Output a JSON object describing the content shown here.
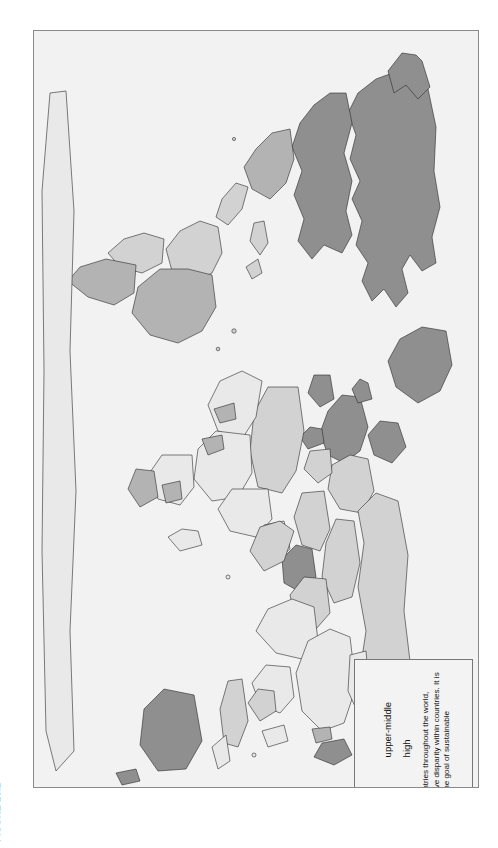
{
  "figure": {
    "label": "FIGURE 13.1"
  },
  "legend": {
    "title": "GNP per Capita in U.S. Dollars",
    "entries": [
      {
        "key": "low",
        "label": "low",
        "color": "#e9e9e9"
      },
      {
        "key": "upper-middle",
        "label": "upper-middle",
        "color": "#b3b3b3"
      },
      {
        "key": "lower-middle",
        "label": "lower-middle",
        "color": "#d2d2d2"
      },
      {
        "key": "high",
        "label": "high",
        "color": "#8f8f8f"
      }
    ],
    "note": "This map depicts relative income of people in countries throughout the world, although it does not address the issue of the relative disparity within countries. It is a summary of the enormous challenge posed by the goal of sustainable development."
  },
  "map": {
    "projection_note": "world map rendered rotated 90 degrees within the plate",
    "background_color": "#f2f2f2",
    "border_color": "#8a8a8a",
    "outline_color": "#2a2a2a",
    "categories": [
      "low",
      "lower-middle",
      "upper-middle",
      "high"
    ],
    "category_colors": {
      "low": "#e9e9e9",
      "lower-middle": "#d2d2d2",
      "upper-middle": "#b3b3b3",
      "high": "#8f8f8f"
    },
    "regions": [
      {
        "name": "north-america-usa",
        "category": "high"
      },
      {
        "name": "north-america-canada",
        "category": "high"
      },
      {
        "name": "greenland",
        "category": "high"
      },
      {
        "name": "mexico",
        "category": "upper-middle"
      },
      {
        "name": "central-america",
        "category": "lower-middle"
      },
      {
        "name": "caribbean",
        "category": "lower-middle"
      },
      {
        "name": "south-america-brazil",
        "category": "upper-middle"
      },
      {
        "name": "south-america-andes",
        "category": "lower-middle"
      },
      {
        "name": "argentina-chile",
        "category": "upper-middle"
      },
      {
        "name": "western-europe",
        "category": "high"
      },
      {
        "name": "eastern-europe",
        "category": "lower-middle"
      },
      {
        "name": "russia",
        "category": "lower-middle"
      },
      {
        "name": "north-africa",
        "category": "lower-middle"
      },
      {
        "name": "sub-saharan-africa",
        "category": "low"
      },
      {
        "name": "south-africa",
        "category": "upper-middle"
      },
      {
        "name": "gabon-botswana",
        "category": "upper-middle"
      },
      {
        "name": "middle-east-gulf",
        "category": "high"
      },
      {
        "name": "middle-east-other",
        "category": "lower-middle"
      },
      {
        "name": "india-south-asia",
        "category": "low"
      },
      {
        "name": "china",
        "category": "low"
      },
      {
        "name": "southeast-asia",
        "category": "low"
      },
      {
        "name": "malaysia-thailand",
        "category": "lower-middle"
      },
      {
        "name": "japan",
        "category": "high"
      },
      {
        "name": "south-korea",
        "category": "upper-middle"
      },
      {
        "name": "australia",
        "category": "high"
      },
      {
        "name": "new-zealand",
        "category": "high"
      },
      {
        "name": "antarctica",
        "category": "low"
      }
    ]
  }
}
